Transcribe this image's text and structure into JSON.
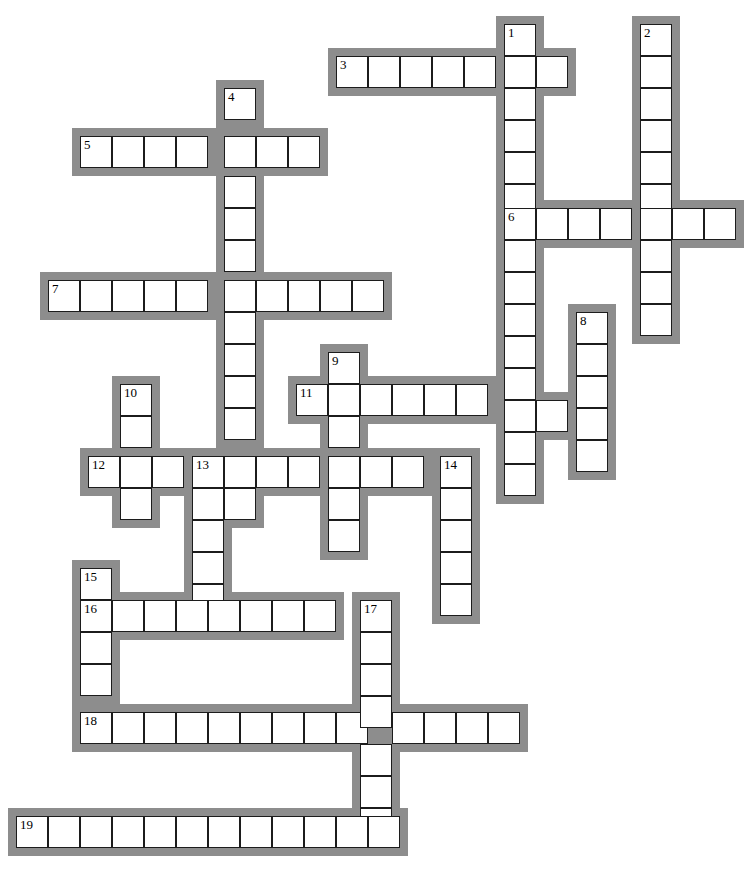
{
  "puzzle": {
    "type": "crossword-grid",
    "title": "Crossword puzzle grid",
    "cell_size": 32,
    "border_thickness": 8,
    "colors": {
      "cell_fill": "#ffffff",
      "cell_stroke": "#1c1c1c",
      "outer_border": "#8d8d8d",
      "background": "#ffffff",
      "number_text": "#000000"
    },
    "canvas": {
      "width": 740,
      "height": 882
    },
    "entry_count": 19,
    "entries": [
      {
        "number": "1",
        "direction": "down",
        "x": 504,
        "y": 24,
        "length": 15
      },
      {
        "number": "2",
        "direction": "down",
        "x": 640,
        "y": 24,
        "length": 10
      },
      {
        "number": "3",
        "direction": "across",
        "x": 336,
        "y": 56,
        "length": 7
      },
      {
        "number": "4",
        "direction": "down",
        "x": 224,
        "y": 88,
        "length": 13
      },
      {
        "number": "5",
        "direction": "across",
        "x": 80,
        "y": 136,
        "length": 8
      },
      {
        "number": "6",
        "direction": "across",
        "x": 504,
        "y": 208,
        "length": 7
      },
      {
        "number": "7",
        "direction": "across",
        "x": 48,
        "y": 280,
        "length": 11
      },
      {
        "number": "8",
        "direction": "down",
        "x": 576,
        "y": 312,
        "length": 5
      },
      {
        "number": "9",
        "direction": "down",
        "x": 328,
        "y": 352,
        "length": 6
      },
      {
        "number": "10",
        "direction": "down",
        "x": 120,
        "y": 384,
        "length": 4
      },
      {
        "number": "11",
        "direction": "across",
        "x": 296,
        "y": 384,
        "length": 10
      },
      {
        "number": "12",
        "direction": "across",
        "x": 88,
        "y": 456,
        "length": 12
      },
      {
        "number": "13",
        "direction": "down",
        "x": 192,
        "y": 456,
        "length": 5
      },
      {
        "number": "14",
        "direction": "down",
        "x": 440,
        "y": 456,
        "length": 5
      },
      {
        "number": "15",
        "direction": "down",
        "x": 80,
        "y": 568,
        "length": 5
      },
      {
        "number": "16",
        "direction": "across",
        "x": 80,
        "y": 600,
        "length": 8
      },
      {
        "number": "17",
        "direction": "down",
        "x": 360,
        "y": 600,
        "length": 8
      },
      {
        "number": "18",
        "direction": "across",
        "x": 80,
        "y": 712,
        "length": 13
      },
      {
        "number": "19",
        "direction": "across",
        "x": 16,
        "y": 816,
        "length": 12
      }
    ],
    "cells": [
      {
        "x": 504,
        "y": 24,
        "num": "1"
      },
      {
        "x": 640,
        "y": 24,
        "num": "2"
      },
      {
        "x": 336,
        "y": 56,
        "num": "3"
      },
      {
        "x": 368,
        "y": 56,
        "num": ""
      },
      {
        "x": 400,
        "y": 56,
        "num": ""
      },
      {
        "x": 432,
        "y": 56,
        "num": ""
      },
      {
        "x": 464,
        "y": 56,
        "num": ""
      },
      {
        "x": 504,
        "y": 56,
        "num": ""
      },
      {
        "x": 536,
        "y": 56,
        "num": ""
      },
      {
        "x": 640,
        "y": 56,
        "num": ""
      },
      {
        "x": 504,
        "y": 88,
        "num": ""
      },
      {
        "x": 640,
        "y": 88,
        "num": ""
      },
      {
        "x": 224,
        "y": 88,
        "num": "4"
      },
      {
        "x": 504,
        "y": 120,
        "num": ""
      },
      {
        "x": 640,
        "y": 120,
        "num": ""
      },
      {
        "x": 80,
        "y": 136,
        "num": "5"
      },
      {
        "x": 112,
        "y": 136,
        "num": ""
      },
      {
        "x": 144,
        "y": 136,
        "num": ""
      },
      {
        "x": 176,
        "y": 136,
        "num": ""
      },
      {
        "x": 224,
        "y": 136,
        "num": ""
      },
      {
        "x": 256,
        "y": 136,
        "num": ""
      },
      {
        "x": 288,
        "y": 136,
        "num": ""
      },
      {
        "x": 504,
        "y": 152,
        "num": ""
      },
      {
        "x": 640,
        "y": 152,
        "num": ""
      },
      {
        "x": 224,
        "y": 176,
        "num": ""
      },
      {
        "x": 504,
        "y": 184,
        "num": ""
      },
      {
        "x": 640,
        "y": 184,
        "num": ""
      },
      {
        "x": 224,
        "y": 208,
        "num": ""
      },
      {
        "x": 504,
        "y": 208,
        "num": "6"
      },
      {
        "x": 536,
        "y": 208,
        "num": ""
      },
      {
        "x": 568,
        "y": 208,
        "num": ""
      },
      {
        "x": 600,
        "y": 208,
        "num": ""
      },
      {
        "x": 640,
        "y": 208,
        "num": ""
      },
      {
        "x": 672,
        "y": 208,
        "num": ""
      },
      {
        "x": 704,
        "y": 208,
        "num": ""
      },
      {
        "x": 224,
        "y": 240,
        "num": ""
      },
      {
        "x": 504,
        "y": 240,
        "num": ""
      },
      {
        "x": 640,
        "y": 240,
        "num": ""
      },
      {
        "x": 48,
        "y": 280,
        "num": "7"
      },
      {
        "x": 80,
        "y": 280,
        "num": ""
      },
      {
        "x": 112,
        "y": 280,
        "num": ""
      },
      {
        "x": 144,
        "y": 280,
        "num": ""
      },
      {
        "x": 176,
        "y": 280,
        "num": ""
      },
      {
        "x": 224,
        "y": 280,
        "num": ""
      },
      {
        "x": 256,
        "y": 280,
        "num": ""
      },
      {
        "x": 288,
        "y": 280,
        "num": ""
      },
      {
        "x": 320,
        "y": 280,
        "num": ""
      },
      {
        "x": 352,
        "y": 280,
        "num": ""
      },
      {
        "x": 504,
        "y": 272,
        "num": ""
      },
      {
        "x": 640,
        "y": 272,
        "num": ""
      },
      {
        "x": 504,
        "y": 304,
        "num": ""
      },
      {
        "x": 640,
        "y": 304,
        "num": ""
      },
      {
        "x": 576,
        "y": 312,
        "num": "8"
      },
      {
        "x": 224,
        "y": 312,
        "num": ""
      },
      {
        "x": 224,
        "y": 344,
        "num": ""
      },
      {
        "x": 328,
        "y": 352,
        "num": "9"
      },
      {
        "x": 504,
        "y": 336,
        "num": ""
      },
      {
        "x": 576,
        "y": 344,
        "num": ""
      },
      {
        "x": 120,
        "y": 384,
        "num": "10"
      },
      {
        "x": 296,
        "y": 384,
        "num": "11"
      },
      {
        "x": 224,
        "y": 376,
        "num": ""
      },
      {
        "x": 504,
        "y": 368,
        "num": ""
      },
      {
        "x": 576,
        "y": 376,
        "num": ""
      },
      {
        "x": 328,
        "y": 384,
        "num": ""
      },
      {
        "x": 360,
        "y": 384,
        "num": ""
      },
      {
        "x": 392,
        "y": 384,
        "num": ""
      },
      {
        "x": 424,
        "y": 384,
        "num": ""
      },
      {
        "x": 456,
        "y": 384,
        "num": ""
      },
      {
        "x": 504,
        "y": 400,
        "num": ""
      },
      {
        "x": 536,
        "y": 400,
        "num": ""
      },
      {
        "x": 576,
        "y": 408,
        "num": ""
      },
      {
        "x": 120,
        "y": 416,
        "num": ""
      },
      {
        "x": 224,
        "y": 408,
        "num": ""
      },
      {
        "x": 328,
        "y": 416,
        "num": ""
      },
      {
        "x": 504,
        "y": 432,
        "num": ""
      },
      {
        "x": 576,
        "y": 440,
        "num": ""
      },
      {
        "x": 88,
        "y": 456,
        "num": "12"
      },
      {
        "x": 120,
        "y": 456,
        "num": ""
      },
      {
        "x": 152,
        "y": 456,
        "num": ""
      },
      {
        "x": 192,
        "y": 456,
        "num": "13"
      },
      {
        "x": 224,
        "y": 456,
        "num": ""
      },
      {
        "x": 256,
        "y": 456,
        "num": ""
      },
      {
        "x": 288,
        "y": 456,
        "num": ""
      },
      {
        "x": 328,
        "y": 456,
        "num": ""
      },
      {
        "x": 360,
        "y": 456,
        "num": ""
      },
      {
        "x": 392,
        "y": 456,
        "num": ""
      },
      {
        "x": 440,
        "y": 456,
        "num": "14"
      },
      {
        "x": 504,
        "y": 464,
        "num": ""
      },
      {
        "x": 120,
        "y": 488,
        "num": ""
      },
      {
        "x": 192,
        "y": 488,
        "num": ""
      },
      {
        "x": 224,
        "y": 488,
        "num": ""
      },
      {
        "x": 328,
        "y": 488,
        "num": ""
      },
      {
        "x": 440,
        "y": 488,
        "num": ""
      },
      {
        "x": 192,
        "y": 520,
        "num": ""
      },
      {
        "x": 328,
        "y": 520,
        "num": ""
      },
      {
        "x": 440,
        "y": 520,
        "num": ""
      },
      {
        "x": 192,
        "y": 552,
        "num": ""
      },
      {
        "x": 440,
        "y": 552,
        "num": ""
      },
      {
        "x": 80,
        "y": 568,
        "num": "15"
      },
      {
        "x": 192,
        "y": 584,
        "num": ""
      },
      {
        "x": 440,
        "y": 584,
        "num": ""
      },
      {
        "x": 80,
        "y": 600,
        "num": "16"
      },
      {
        "x": 112,
        "y": 600,
        "num": ""
      },
      {
        "x": 144,
        "y": 600,
        "num": ""
      },
      {
        "x": 176,
        "y": 600,
        "num": ""
      },
      {
        "x": 208,
        "y": 600,
        "num": ""
      },
      {
        "x": 240,
        "y": 600,
        "num": ""
      },
      {
        "x": 272,
        "y": 600,
        "num": ""
      },
      {
        "x": 304,
        "y": 600,
        "num": ""
      },
      {
        "x": 360,
        "y": 600,
        "num": "17"
      },
      {
        "x": 80,
        "y": 632,
        "num": ""
      },
      {
        "x": 360,
        "y": 632,
        "num": ""
      },
      {
        "x": 80,
        "y": 664,
        "num": ""
      },
      {
        "x": 360,
        "y": 664,
        "num": ""
      },
      {
        "x": 80,
        "y": 712,
        "num": "18"
      },
      {
        "x": 112,
        "y": 712,
        "num": ""
      },
      {
        "x": 144,
        "y": 712,
        "num": ""
      },
      {
        "x": 176,
        "y": 712,
        "num": ""
      },
      {
        "x": 208,
        "y": 712,
        "num": ""
      },
      {
        "x": 240,
        "y": 712,
        "num": ""
      },
      {
        "x": 272,
        "y": 712,
        "num": ""
      },
      {
        "x": 304,
        "y": 712,
        "num": ""
      },
      {
        "x": 336,
        "y": 712,
        "num": ""
      },
      {
        "x": 360,
        "y": 696,
        "num": ""
      },
      {
        "x": 392,
        "y": 712,
        "num": ""
      },
      {
        "x": 424,
        "y": 712,
        "num": ""
      },
      {
        "x": 456,
        "y": 712,
        "num": ""
      },
      {
        "x": 488,
        "y": 712,
        "num": ""
      },
      {
        "x": 360,
        "y": 744,
        "num": ""
      },
      {
        "x": 360,
        "y": 776,
        "num": ""
      },
      {
        "x": 360,
        "y": 808,
        "num": ""
      },
      {
        "x": 16,
        "y": 816,
        "num": "19"
      },
      {
        "x": 48,
        "y": 816,
        "num": ""
      },
      {
        "x": 80,
        "y": 816,
        "num": ""
      },
      {
        "x": 112,
        "y": 816,
        "num": ""
      },
      {
        "x": 144,
        "y": 816,
        "num": ""
      },
      {
        "x": 176,
        "y": 816,
        "num": ""
      },
      {
        "x": 208,
        "y": 816,
        "num": ""
      },
      {
        "x": 240,
        "y": 816,
        "num": ""
      },
      {
        "x": 272,
        "y": 816,
        "num": ""
      },
      {
        "x": 304,
        "y": 816,
        "num": ""
      },
      {
        "x": 336,
        "y": 816,
        "num": ""
      },
      {
        "x": 368,
        "y": 816,
        "num": ""
      }
    ]
  }
}
